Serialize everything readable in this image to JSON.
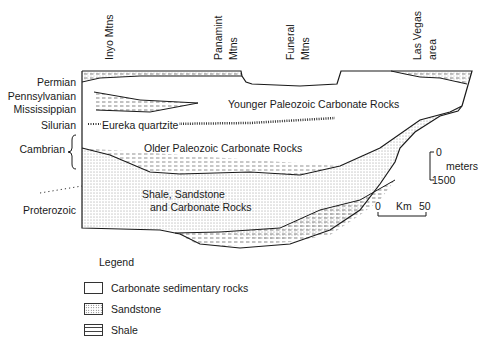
{
  "locations": [
    {
      "name": "Inyo Mtns",
      "lines": [
        "Inyo Mtns"
      ]
    },
    {
      "name": "Panamint Mtns",
      "lines": [
        "Panamint",
        "Mtns"
      ]
    },
    {
      "name": "Funeral Mtns",
      "lines": [
        "Funeral",
        "Mtns"
      ]
    },
    {
      "name": "Las Vegas area",
      "lines": [
        "Las Vegas",
        "area"
      ]
    }
  ],
  "periods": [
    "Permian",
    "Pennsylvanian",
    "Mississippian",
    "Silurian",
    "Cambrian",
    "Proterozoic"
  ],
  "units": {
    "younger": "Younger Paleozoic Carbonate Rocks",
    "eureka": "Eureka quartzite",
    "older": "Older Paleozoic Carbonate Rocks",
    "shale_sand_line1": "Shale, Sandstone",
    "shale_sand_line2": "and Carbonate Rocks"
  },
  "scales": {
    "vertical_top": "0",
    "vertical_unit": "meters",
    "vertical_bottom": "1500",
    "horizontal_left": "0",
    "horizontal_unit": "Km",
    "horizontal_right": "50"
  },
  "legend": {
    "title": "Legend",
    "items": [
      {
        "label": "Carbonate sedimentary rocks",
        "pattern": "blank"
      },
      {
        "label": "Sandstone",
        "pattern": "dots"
      },
      {
        "label": "Shale",
        "pattern": "dashes"
      }
    ]
  },
  "colors": {
    "line": "#1a1a1a",
    "background": "#ffffff"
  }
}
